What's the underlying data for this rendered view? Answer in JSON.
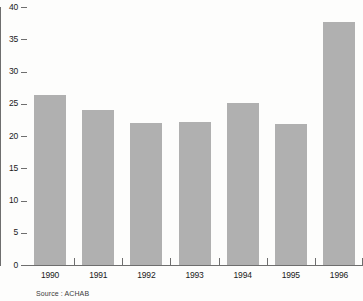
{
  "chart_data": {
    "type": "bar",
    "title": "",
    "subtitle": "",
    "xlabel": "",
    "ylabel": "",
    "categories": [
      "1990",
      "1991",
      "1992",
      "1993",
      "1994",
      "1995",
      "1996"
    ],
    "values": [
      26.3,
      24.0,
      22.0,
      22.2,
      25.1,
      21.9,
      37.7
    ],
    "series": [
      {
        "name": "",
        "values": [
          26.3,
          24.0,
          22.0,
          22.2,
          25.1,
          21.9,
          37.7
        ]
      }
    ],
    "ylim": [
      0,
      40
    ],
    "ytick_labels": [
      "0",
      "5",
      "10",
      "15",
      "20",
      "25",
      "30",
      "35",
      "40"
    ],
    "ytick_values": [
      0,
      5,
      10,
      15,
      20,
      25,
      30,
      35,
      40
    ],
    "xtick_labels": [
      "1990",
      "1991",
      "1992",
      "1993",
      "1994",
      "1995",
      "1996"
    ],
    "grid": false,
    "legend": false,
    "legend_position": "none",
    "annotations": [
      "Source : ACHAB"
    ],
    "bar_color": "#b0b0b0",
    "axis_color": "#6e6e6e",
    "text_color": "#1a1a1a",
    "background_color": "#fdfdfc"
  },
  "footer": {
    "source_note": "Source : ACHAB"
  }
}
